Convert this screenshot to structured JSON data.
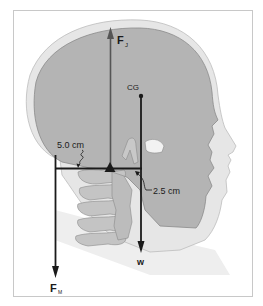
{
  "figure": {
    "labels": {
      "joint_force": "F",
      "joint_force_sub": "J",
      "muscle_force": "F",
      "muscle_force_sub": "M",
      "weight": "w",
      "center_of_gravity": "CG",
      "muscle_lever_arm": "5.0  cm",
      "weight_lever_arm": "2.5  cm"
    },
    "colors": {
      "frame": "#c8c8c8",
      "head_outline_fill": "#e6e6e6",
      "skull_fill": "#b4b4b4",
      "vertebrae_fill": "#c4c4c4",
      "arrow_dark": "#1a1a1a",
      "arrow_fj": "#555555",
      "background": "#ffffff"
    }
  }
}
